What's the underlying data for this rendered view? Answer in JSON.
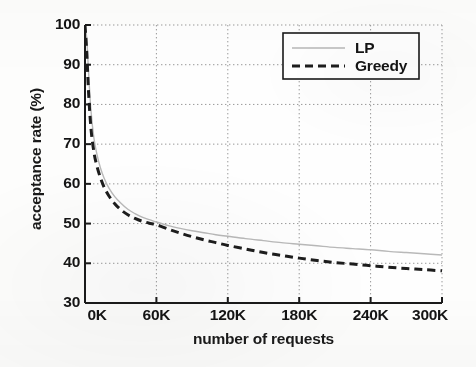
{
  "chart_data": {
    "type": "line",
    "title": "",
    "xlabel": "number of requests",
    "ylabel": "acceptance rate (%)",
    "xlim": [
      0,
      300000
    ],
    "ylim": [
      30,
      100
    ],
    "grid": true,
    "grid_style": "dotted",
    "legend_position": "top-right",
    "xticks": [
      0,
      60000,
      120000,
      180000,
      240000,
      300000
    ],
    "xticklabels": [
      "0K",
      "60K",
      "120K",
      "180K",
      "240K",
      "300K"
    ],
    "yticks": [
      30,
      40,
      50,
      60,
      70,
      80,
      90,
      100
    ],
    "yticklabels": [
      "30",
      "40",
      "50",
      "60",
      "70",
      "80",
      "90",
      "100"
    ],
    "series": [
      {
        "name": "LP",
        "color": "#b9b9b9",
        "style": "solid",
        "width": 1.4,
        "x": [
          0,
          1500,
          3000,
          5000,
          7500,
          10000,
          13000,
          16000,
          20000,
          25000,
          30000,
          36000,
          42000,
          48000,
          54000,
          60000,
          70000,
          80000,
          90000,
          100000,
          110000,
          120000,
          135000,
          150000,
          165000,
          180000,
          195000,
          210000,
          225000,
          240000,
          255000,
          270000,
          285000,
          300000
        ],
        "y": [
          100,
          96.5,
          88.0,
          78.5,
          71.5,
          67.5,
          64.0,
          61.5,
          59.0,
          56.8,
          55.2,
          53.6,
          52.5,
          51.6,
          51.0,
          50.4,
          49.5,
          48.8,
          48.2,
          47.7,
          47.2,
          46.8,
          46.2,
          45.7,
          45.2,
          44.8,
          44.4,
          44.0,
          43.7,
          43.4,
          43.0,
          42.7,
          42.4,
          42.1
        ]
      },
      {
        "name": "Greedy",
        "color": "#1d1d1d",
        "style": "dashed",
        "width": 3.0,
        "x": [
          0,
          1500,
          3000,
          5000,
          7500,
          10000,
          13000,
          16000,
          20000,
          25000,
          30000,
          36000,
          42000,
          48000,
          54000,
          60000,
          70000,
          80000,
          90000,
          100000,
          110000,
          120000,
          135000,
          150000,
          165000,
          180000,
          195000,
          210000,
          225000,
          240000,
          255000,
          270000,
          285000,
          300000
        ],
        "y": [
          100,
          93.0,
          83.0,
          74.0,
          68.0,
          64.5,
          61.5,
          59.2,
          57.0,
          55.0,
          53.5,
          52.2,
          51.3,
          50.6,
          50.1,
          49.7,
          48.6,
          47.6,
          46.7,
          45.9,
          45.2,
          44.5,
          43.6,
          42.7,
          42.0,
          41.3,
          40.7,
          40.2,
          39.8,
          39.4,
          39.0,
          38.7,
          38.4,
          38.1
        ]
      }
    ]
  },
  "legend": {
    "entries": [
      {
        "label": "LP"
      },
      {
        "label": "Greedy"
      }
    ]
  },
  "axes": {
    "x_label": "number of requests",
    "y_label": "acceptance rate (%)"
  }
}
